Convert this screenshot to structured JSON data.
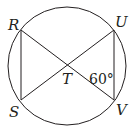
{
  "diagram": {
    "type": "circle-inscribed-chords",
    "circle": {
      "cx": 67,
      "cy": 66,
      "r": 59
    },
    "points": {
      "R": {
        "x": 21,
        "y": 30,
        "label": "R"
      },
      "U": {
        "x": 114,
        "y": 30,
        "label": "U"
      },
      "S": {
        "x": 21,
        "y": 100,
        "label": "S"
      },
      "V": {
        "x": 114,
        "y": 100,
        "label": "V"
      },
      "T": {
        "x": 67.5,
        "y": 65,
        "label": "T"
      }
    },
    "segments": [
      "RS",
      "UV",
      "RV",
      "SU"
    ],
    "angle_label": "60°",
    "angle_at": "T, angle UTV region near V",
    "stroke_color": "#231f20"
  }
}
